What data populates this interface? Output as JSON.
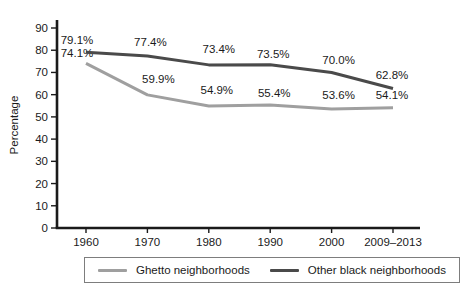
{
  "figure": {
    "background": "#ffffff"
  },
  "chart_data": {
    "type": "line",
    "title": "",
    "xlabel": "",
    "ylabel": "Percentage",
    "ylim": [
      0,
      90
    ],
    "ytick_step": 10,
    "grid": false,
    "legend_position": "bottom",
    "categories": [
      "1960",
      "1970",
      "1980",
      "1990",
      "2000",
      "2009–2013"
    ],
    "series": [
      {
        "name": "Ghetto neighborhoods",
        "color": "#9f9f9f",
        "values": [
          74.1,
          59.9,
          54.9,
          55.4,
          53.6,
          54.1
        ],
        "point_labels": [
          "74.1%",
          "59.9%",
          "54.9%",
          "55.4%",
          "53.6%",
          "54.1%"
        ],
        "label_offsets": [
          [
            -9,
            -6
          ],
          [
            11,
            -12
          ],
          [
            8,
            -12
          ],
          [
            4,
            -8
          ],
          [
            7,
            -10
          ],
          [
            -1,
            -9
          ]
        ]
      },
      {
        "name": "Other black neighborhoods",
        "color": "#4a4a4a",
        "values": [
          79.1,
          77.4,
          73.4,
          73.5,
          70.0,
          62.8
        ],
        "point_labels": [
          "79.1%",
          "77.4%",
          "73.4%",
          "73.5%",
          "70.0%",
          "62.8%"
        ],
        "label_offsets": [
          [
            -9,
            -8
          ],
          [
            3,
            -10
          ],
          [
            10,
            -12
          ],
          [
            3,
            -7
          ],
          [
            7,
            -8
          ],
          [
            -1,
            -9
          ]
        ]
      }
    ],
    "text_color": "#1a1a1a",
    "axis_color": "#1a1a1a"
  }
}
